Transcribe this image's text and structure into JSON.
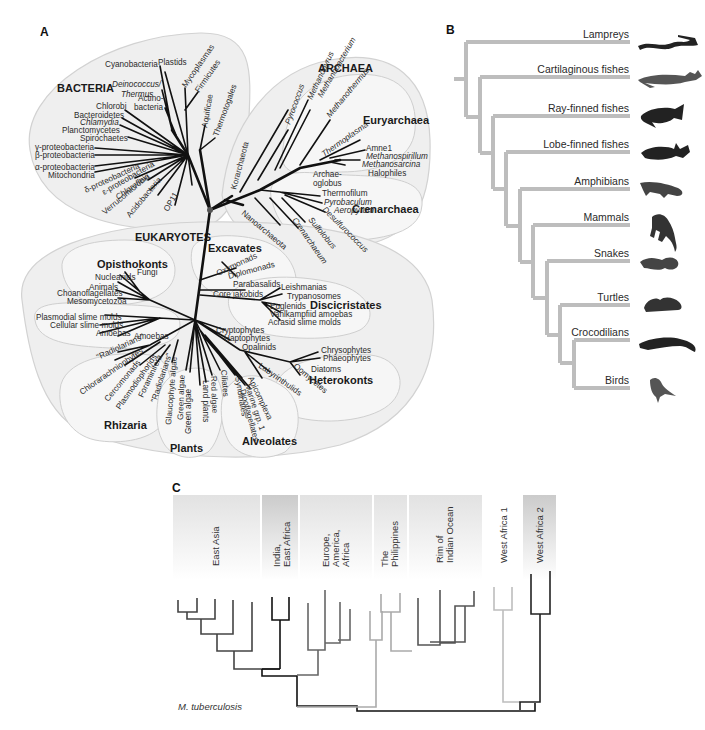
{
  "panels": {
    "a": {
      "letter": "A",
      "domains": {
        "bacteria": "BACTERIA",
        "archaea": "ARCHAEA",
        "eukaryotes": "EUKARYOTES"
      },
      "subgroups": {
        "euryarchaea": "Euryarchaea",
        "crenarchaea": "Crenarchaea",
        "opisthokonts": "Opisthokonts",
        "excavates": "Excavates",
        "discicristates": "Discicristates",
        "heterokonts": "Heterokonts",
        "rhizaria": "Rhizaria",
        "plants": "Plants",
        "alveolates": "Alveolates"
      },
      "bacteria_taxa": [
        "Cyanobacteria",
        "Plastids",
        "Deinococcus/",
        "Thermus",
        "Actino-",
        "bacteria",
        "Mycoplasmas",
        "Firmicutes",
        "Chlorobi",
        "Bacteroidetes",
        "Chlamydia",
        "Planctomycetes",
        "Spirochaetes",
        "γ-proteobacteria",
        "β-proteobacteria",
        "α-proteobacteria",
        "Mitochondria",
        "δ-proteobacteria",
        "ε-proteobacteria",
        "Chloroflexi",
        "Verrucomicrobia",
        "Acidobacteria",
        "OP11",
        "Aquificae",
        "Thermotogales"
      ],
      "archaea_taxa": [
        "Korarchaeota",
        "Nanoarchaeota",
        "Pyrococcus",
        "Methanopyrus",
        "Methanobacterium",
        "Methanothermus",
        "Thermoplasma",
        "Amne1",
        "Methanospirillum",
        "Methanosarcina",
        "Halophiles",
        "Archae-",
        "oglobus",
        "Thermofilum",
        "Pyrobaculum",
        "Aeropyrum",
        "Desulfurococcus",
        "Sulfolobus",
        "Crenarchaeum"
      ],
      "eukaryote_taxa": [
        "Nucleariids",
        "Fungi",
        "Animals",
        "Choanoflagellates",
        "Mesomycetozoa",
        "Plasmodial slime molds",
        "Cellular slime molds",
        "Amoebas",
        "Amoebas",
        "Oxymonads",
        "Diplomonads",
        "Parabasalids",
        "Core jakobids",
        "Leishmanias",
        "Trypanosomes",
        "Euglenids",
        "Vahlkampfiid amoebas",
        "Acrasid slime molds",
        "Cryptophytes",
        "Haptophytes",
        "Opalinids",
        "Chrysophytes",
        "Phaeophytes",
        "Diatoms",
        "Oomycetes",
        "Labyrinthulids",
        "\"Radiolarians\"",
        "Chlorarachniophytes",
        "Cercomonads",
        "Plasmodiophorids",
        "Foraminifera",
        "\"Radiolarians\"",
        "Glaucophyte algae",
        "Green algae",
        "Green algae",
        "Land plants",
        "Red algae",
        "Ciliates",
        "Syndinales",
        "Apicomplexa",
        "Marine grp. 1",
        "Dinoflagellates"
      ]
    },
    "b": {
      "letter": "B",
      "taxa": [
        {
          "label": "Lampreys",
          "icon": "lamprey-icon"
        },
        {
          "label": "Cartilaginous fishes",
          "icon": "shark-icon"
        },
        {
          "label": "Ray-finned fishes",
          "icon": "ray-finned-fish-icon"
        },
        {
          "label": "Lobe-finned fishes",
          "icon": "coelacanth-icon"
        },
        {
          "label": "Amphibians",
          "icon": "salamander-icon"
        },
        {
          "label": "Mammals",
          "icon": "monkey-icon"
        },
        {
          "label": "Snakes",
          "icon": "snake-icon"
        },
        {
          "label": "Turtles",
          "icon": "turtle-icon"
        },
        {
          "label": "Crocodilians",
          "icon": "crocodile-icon"
        },
        {
          "label": "Birds",
          "icon": "bird-icon"
        }
      ],
      "branch_color": "#bdbdbd"
    },
    "c": {
      "letter": "C",
      "regions": [
        {
          "label": "East Asia"
        },
        {
          "label": "India,\nEast Africa",
          "line1": "India,",
          "line2": "East Africa"
        },
        {
          "label": "Europe,\nAmerica,\nAfrica",
          "line1": "Europe,",
          "line2": "America,",
          "line3": "Africa"
        },
        {
          "label": "The\nPhilippines",
          "line1": "The",
          "line2": "Philippines"
        },
        {
          "label": "Rim of\nIndian Ocean",
          "line1": "Rim of",
          "line2": "Indian Ocean"
        },
        {
          "label": "West Africa 1"
        },
        {
          "label": "West Africa 2"
        }
      ],
      "root_label": "M. tuberculosis"
    }
  }
}
